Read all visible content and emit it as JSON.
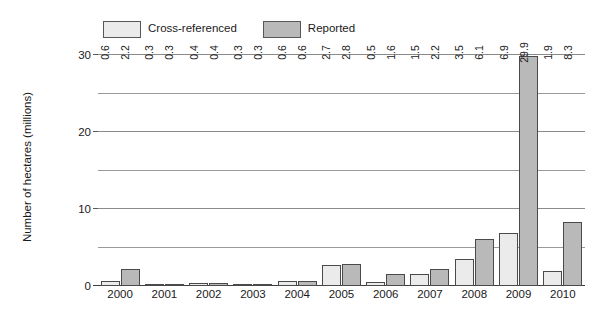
{
  "chart_data": {
    "type": "bar",
    "title": "",
    "xlabel": "",
    "ylabel": "Number of hectares (millions)",
    "categories": [
      "2000",
      "2001",
      "2002",
      "2003",
      "2004",
      "2005",
      "2006",
      "2007",
      "2008",
      "2009",
      "2010"
    ],
    "series": [
      {
        "name": "Cross-referenced",
        "color": "#ebebeb",
        "values": [
          0.6,
          0.3,
          0.4,
          0.3,
          0.6,
          2.7,
          0.5,
          1.5,
          3.5,
          6.9,
          1.9
        ]
      },
      {
        "name": "Reported",
        "color": "#b9b9b9",
        "values": [
          2.2,
          0.3,
          0.4,
          0.3,
          0.6,
          2.8,
          1.6,
          2.2,
          6.1,
          29.9,
          8.3
        ]
      }
    ],
    "ylim": [
      0,
      30
    ],
    "yticks": [
      0,
      10,
      20,
      30
    ],
    "ytick_labels": [
      "0",
      "10",
      "20",
      "30"
    ],
    "minor_gridlines": [
      5,
      15,
      25
    ],
    "grid": true,
    "legend_position": "top-left",
    "value_labels": true,
    "value_label_rotation": -90
  },
  "legend": {
    "items": [
      {
        "label": "Cross-referenced",
        "swatch": "#ebebeb"
      },
      {
        "label": "Reported",
        "swatch": "#b9b9b9"
      }
    ]
  },
  "colors": {
    "series_a": "#ebebeb",
    "series_b": "#b9b9b9",
    "bar_border": "#4a4a4a",
    "gridline": "#9a9a9a",
    "axis": "#3d3d3d",
    "text": "#1a1a1a",
    "background": "#ffffff"
  }
}
